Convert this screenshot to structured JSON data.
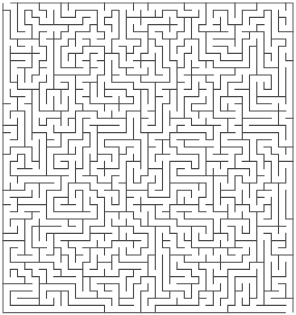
{
  "image": {
    "kind": "maze",
    "description": "Rectangular orthogonal grid maze, dark gray walls on white background"
  },
  "maze": {
    "cols": 40,
    "rows": 43,
    "origin_x": 3,
    "origin_y": 3,
    "cell_w": 7.25,
    "cell_h": 7.2,
    "seed": 20240517,
    "wall_color": "#4a4a4a",
    "border_color": "#6a6a6a",
    "background": "#ffffff",
    "wall_width": 1.1,
    "entrance": {
      "side": "top",
      "col": 0
    },
    "exit": {
      "side": "bottom",
      "col": 39
    }
  }
}
